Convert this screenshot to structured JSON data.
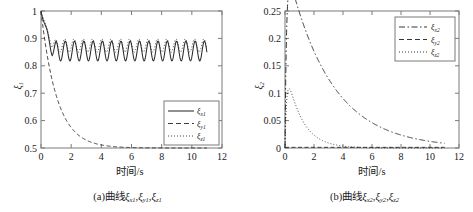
{
  "figure": {
    "background": "#ffffff",
    "axis_color": "#7a7a7a",
    "curve_color": "#2b2b2b"
  },
  "panel_a": {
    "caption": "(a)曲线ξx1,ξy1,ξz1",
    "caption_prefix": "(a)曲线",
    "xlabel": "时间/s",
    "ylabel": "ξ1",
    "legend": [
      {
        "label": "ξx1",
        "style": "solid"
      },
      {
        "label": "ξy1",
        "style": "dashed"
      },
      {
        "label": "ξz1",
        "style": "dotted"
      }
    ]
  },
  "panel_b": {
    "caption": "(b)曲线ξx2,ξy2,ξz2",
    "caption_prefix": "(b)曲线",
    "xlabel": "时间/s",
    "ylabel": "ξ2",
    "legend": [
      {
        "label": "ξx2",
        "style": "dashdot"
      },
      {
        "label": "ξy2",
        "style": "dashed"
      },
      {
        "label": "ξz2",
        "style": "dotted"
      }
    ]
  },
  "chart_data": [
    {
      "type": "line",
      "panel": "a",
      "title": "(a)曲线ξx1,ξy1,ξz1",
      "xlabel": "时间/s",
      "ylabel": "ξ1",
      "xlim": [
        0,
        12
      ],
      "ylim": [
        0.5,
        1.0
      ],
      "xticks": [
        0,
        2,
        4,
        6,
        8,
        10,
        12
      ],
      "xticklabels": [
        "0",
        "2",
        "4",
        "6",
        "8",
        "10",
        "12"
      ],
      "yticks": [
        0.5,
        0.6,
        0.7,
        0.8,
        0.9,
        1.0
      ],
      "yticklabels": [
        "0.5",
        "0.6",
        "0.7",
        "0.8",
        "0.9",
        "1"
      ],
      "grid": false,
      "legend_position": "lower-right",
      "series": [
        {
          "name": "ξx1",
          "style": "solid",
          "description": "starts at 1.0, drops sharply to ~0.80 by t=0.45, then sustained oscillation about mean 0.855 with amplitude ~0.035 and period ~0.62 s, continuing until t=11",
          "x": [
            0,
            0.1,
            0.2,
            0.3,
            0.45,
            0.6,
            0.75,
            0.9,
            1.05,
            1.2,
            1.4,
            1.6,
            1.8,
            2.0,
            2.3,
            2.6,
            3.0,
            3.5,
            4.0,
            5.0,
            6.0,
            7.0,
            8.0,
            9.0,
            10.0,
            11.0
          ],
          "y": [
            1.0,
            0.955,
            0.895,
            0.845,
            0.8,
            0.828,
            0.866,
            0.846,
            0.818,
            0.838,
            0.88,
            0.843,
            0.82,
            0.855,
            0.884,
            0.826,
            0.869,
            0.823,
            0.884,
            0.826,
            0.885,
            0.824,
            0.884,
            0.825,
            0.885,
            0.851
          ]
        },
        {
          "name": "ξy1",
          "style": "dashed",
          "description": "monotone exponential decay from 1.0 at t=0 to 0.5 asymptote, reaching ~0.505 at t=4 and flat at 0.5 thereafter to t=11",
          "x": [
            0,
            0.2,
            0.4,
            0.6,
            0.8,
            1.0,
            1.25,
            1.5,
            1.75,
            2.0,
            2.5,
            3.0,
            3.5,
            4.0,
            5.0,
            6.0,
            8.0,
            10.0,
            11.0
          ],
          "y": [
            1.0,
            0.925,
            0.862,
            0.808,
            0.762,
            0.722,
            0.681,
            0.647,
            0.62,
            0.597,
            0.563,
            0.54,
            0.525,
            0.514,
            0.504,
            0.501,
            0.5,
            0.5,
            0.5
          ]
        },
        {
          "name": "ξz1",
          "style": "dotted",
          "description": "starts at 1.0, dips to ~0.84 then oscillates about mean 0.875 with amplitude ~0.025, slightly above the solid curve, until t=11",
          "x": [
            0,
            0.15,
            0.3,
            0.5,
            0.7,
            0.9,
            1.1,
            1.35,
            1.6,
            2.0,
            2.5,
            3.0,
            4.0,
            5.0,
            6.0,
            7.0,
            8.0,
            9.0,
            10.0,
            11.0
          ],
          "y": [
            1.0,
            0.935,
            0.88,
            0.846,
            0.874,
            0.903,
            0.872,
            0.852,
            0.878,
            0.898,
            0.857,
            0.89,
            0.897,
            0.855,
            0.897,
            0.856,
            0.897,
            0.857,
            0.897,
            0.877
          ]
        }
      ]
    },
    {
      "type": "line",
      "panel": "b",
      "title": "(b)曲线ξx2,ξy2,ξz2",
      "xlabel": "时间/s",
      "ylabel": "ξ2",
      "xlim": [
        0,
        12
      ],
      "ylim": [
        0,
        0.25
      ],
      "xticks": [
        0,
        2,
        4,
        6,
        8,
        10,
        12
      ],
      "xticklabels": [
        "0",
        "2",
        "4",
        "6",
        "8",
        "10",
        "12"
      ],
      "yticks": [
        0,
        0.05,
        0.1,
        0.15,
        0.2,
        0.25
      ],
      "yticklabels": [
        "0",
        "0.05",
        "0.1",
        "0.15",
        "0.2",
        "0.25"
      ],
      "grid": false,
      "legend_position": "upper-right",
      "series": [
        {
          "name": "ξx2",
          "style": "dashdot",
          "description": "rises almost vertically from 0 to peak 0.227 at t≈0.18, then smooth exponential decay, ~0.10 at t=3, ~0.03 at t=6, near 0 by t=9, flat to t=11",
          "x": [
            0,
            0.08,
            0.18,
            0.3,
            0.5,
            0.8,
            1.2,
            1.6,
            2.0,
            2.5,
            3.0,
            3.5,
            4.0,
            5.0,
            6.0,
            7.0,
            8.0,
            9.0,
            10.0,
            11.0
          ],
          "y": [
            0,
            0.16,
            0.227,
            0.219,
            0.202,
            0.18,
            0.155,
            0.133,
            0.118,
            0.104,
            0.092,
            0.079,
            0.068,
            0.047,
            0.03,
            0.018,
            0.009,
            0.004,
            0.002,
            0.001
          ]
        },
        {
          "name": "ξy2",
          "style": "dashed",
          "description": "remains essentially flat at 0 across the full 0 to 11 s range",
          "x": [
            0,
            1,
            2,
            3,
            4,
            5,
            6,
            7,
            8,
            9,
            10,
            11
          ],
          "y": [
            0,
            0.001,
            0.001,
            0.001,
            0.001,
            0.001,
            0.001,
            0.001,
            0.001,
            0.001,
            0.001,
            0.001
          ]
        },
        {
          "name": "ξz2",
          "style": "dotted",
          "description": "rises steeply from 0 to peak 0.101 at t≈0.22, then decays faster than ξx2, ~0.035 at t=1.5, ~0.012 at t=2.5, near 0 from t=4 onward",
          "x": [
            0,
            0.1,
            0.22,
            0.35,
            0.5,
            0.75,
            1.0,
            1.25,
            1.5,
            2.0,
            2.5,
            3.0,
            3.5,
            4.0,
            5.0,
            6.0,
            8.0,
            10.0,
            11.0
          ],
          "y": [
            0,
            0.072,
            0.101,
            0.096,
            0.086,
            0.07,
            0.056,
            0.045,
            0.035,
            0.022,
            0.013,
            0.008,
            0.005,
            0.003,
            0.001,
            0.001,
            0.0,
            0.0,
            0.0
          ]
        }
      ]
    }
  ]
}
